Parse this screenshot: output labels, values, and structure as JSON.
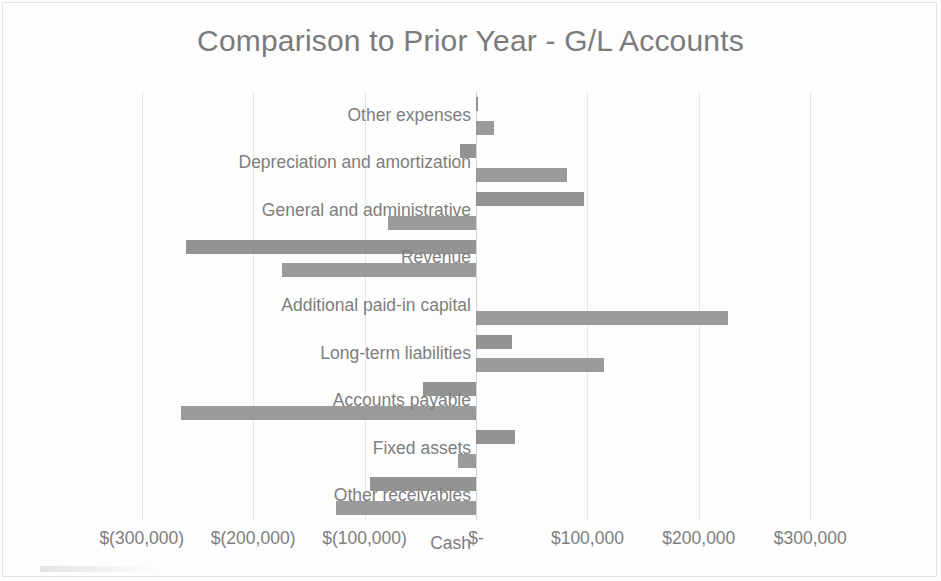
{
  "chart_data": {
    "type": "bar",
    "orientation": "horizontal",
    "title": "Comparison to Prior Year - G/L Accounts",
    "xlabel": "",
    "ylabel": "",
    "xlim": [
      -350000,
      350000
    ],
    "grid": true,
    "legend": "none",
    "tick_labels": [
      "$(300,000)",
      "$(200,000)",
      "$(100,000)",
      "$-",
      "$100,000",
      "$200,000",
      "$300,000"
    ],
    "tick_values": [
      -300000,
      -200000,
      -100000,
      0,
      100000,
      200000,
      300000
    ],
    "categories": [
      "Other expenses",
      "Depreciation and amortization",
      "General and administrative",
      "Revenue",
      "Additional paid-in capital",
      "Long-term liabilities",
      "Accounts payable",
      "Fixed assets",
      "Other receivables",
      "Cash"
    ],
    "series": [
      {
        "name": "Series 1",
        "values": [
          1000,
          16000,
          82000,
          -79000,
          -174000,
          32000,
          115000,
          -48000,
          35000,
          -16000
        ]
      },
      {
        "name": "Series 2",
        "values": [
          -14000,
          97000,
          -260000,
          0,
          226000,
          -265000,
          -95000,
          -126000,
          0,
          0
        ]
      }
    ],
    "bars": [
      {
        "category": "Other expenses",
        "row": 0,
        "value": 1000
      },
      {
        "category": "Other expenses",
        "row": 1,
        "value": 16000
      },
      {
        "category": "Depreciation and amortization",
        "row": 2,
        "value": -14000
      },
      {
        "category": "Depreciation and amortization",
        "row": 3,
        "value": 82000
      },
      {
        "category": "General and administrative",
        "row": 4,
        "value": 97000
      },
      {
        "category": "General and administrative",
        "row": 5,
        "value": -79000
      },
      {
        "category": "Revenue",
        "row": 6,
        "value": -260000
      },
      {
        "category": "Revenue",
        "row": 7,
        "value": -174000
      },
      {
        "category": "Additional paid-in capital",
        "row": 8,
        "value": 0
      },
      {
        "category": "Long-term liabilities",
        "row": 9,
        "value": 226000
      },
      {
        "category": "Long-term liabilities",
        "row": 10,
        "value": 32000
      },
      {
        "category": "Accounts payable",
        "row": 11,
        "value": 115000
      },
      {
        "category": "Accounts payable",
        "row": 12,
        "value": -48000
      },
      {
        "category": "Fixed assets",
        "row": 13,
        "value": -265000
      },
      {
        "category": "Other receivables",
        "row": 14,
        "value": 35000
      },
      {
        "category": "Other receivables",
        "row": 15,
        "value": -16000
      },
      {
        "category": "Cash",
        "row": 16,
        "value": -95000
      },
      {
        "category": "Cash",
        "row": 17,
        "value": -126000
      }
    ],
    "colors": {
      "bar": "#848484",
      "title_text": "#7b7b7b",
      "axis_text": "#7e7e7e",
      "gridline": "#e6e6e6",
      "background": "#fdfdfd"
    }
  }
}
